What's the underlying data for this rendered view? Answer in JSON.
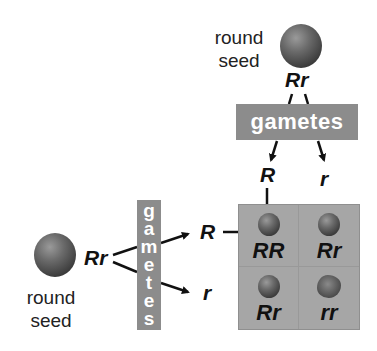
{
  "diagram": {
    "top_parent": {
      "label_line1": "round",
      "label_line2": "seed",
      "genotype": "Rr",
      "phenotype_icon": "round-seed-icon"
    },
    "left_parent": {
      "label_line1": "round",
      "label_line2": "seed",
      "genotype": "Rr",
      "phenotype_icon": "round-seed-icon"
    },
    "top_gametes": {
      "title": "gametes",
      "alleles": [
        "R",
        "r"
      ]
    },
    "left_gametes": {
      "title": "gametes",
      "title_letters": [
        "g",
        "a",
        "m",
        "e",
        "t",
        "e",
        "s"
      ],
      "alleles": [
        "R",
        "r"
      ]
    },
    "punnett_square": {
      "cells": [
        {
          "genotype": "RR",
          "seed": "round"
        },
        {
          "genotype": "Rr",
          "seed": "round"
        },
        {
          "genotype": "Rr",
          "seed": "round"
        },
        {
          "genotype": "rr",
          "seed": "wrinkled"
        }
      ]
    },
    "colors": {
      "box_gray": "#8c8c8c",
      "grid_gray": "#a6a6a6",
      "text": "#111111"
    }
  }
}
